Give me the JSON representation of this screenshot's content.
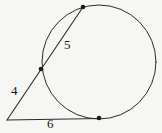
{
  "figure": {
    "name": "circle-tangent-secant-diagram",
    "background_color": "#f6f6f4",
    "stroke_color": "#2b2b2b",
    "label_color": "#1a1a1a"
  },
  "labels": {
    "secant_inside": "5",
    "external_segment": "4",
    "tangent": "6"
  },
  "geometry": {
    "circle": {
      "cx": 99,
      "cy": 62,
      "r": 57
    },
    "external_point": {
      "x": 7,
      "y": 120
    },
    "secant_near_point": {
      "x": 41,
      "y": 69
    },
    "secant_far_point": {
      "x": 83,
      "y": 7
    },
    "tangent_point": {
      "x": 99,
      "y": 118
    },
    "points": [
      {
        "name": "secant-far-point",
        "x": 83,
        "y": 7
      },
      {
        "name": "secant-near-point",
        "x": 41,
        "y": 69
      },
      {
        "name": "tangent-point",
        "x": 99,
        "y": 118
      }
    ]
  }
}
